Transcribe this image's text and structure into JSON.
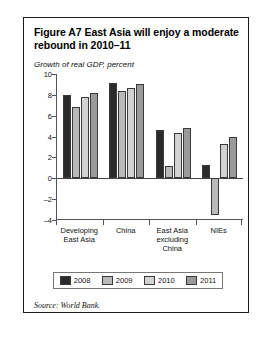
{
  "figure": {
    "title": "Figure A7  East Asia will enjoy a moderate rebound in 2010–11",
    "subtitle": "Growth of real GDP, percent",
    "source": "Source: World Bank."
  },
  "chart_data": {
    "type": "bar",
    "title": "Figure A7  East Asia will enjoy a moderate rebound in 2010–11",
    "subtitle": "Growth of real GDP, percent",
    "xlabel": "",
    "ylabel": "Growth of real GDP, percent",
    "ylim": [
      -4,
      10
    ],
    "ytick_step": 2,
    "yticks": [
      10,
      8,
      6,
      4,
      2,
      0,
      -2,
      -4
    ],
    "ytick_labels": [
      "10",
      "8",
      "6",
      "4",
      "2",
      "0",
      "–2",
      "–4"
    ],
    "grid": false,
    "legend_position": "bottom",
    "categories": [
      "Developing East Asia",
      "China",
      "East Asia excluding China",
      "NIEs"
    ],
    "series": [
      {
        "name": "2008",
        "color": "#2b2b2b",
        "values": [
          8.0,
          9.1,
          4.6,
          1.3
        ]
      },
      {
        "name": "2009",
        "color": "#b9b9b9",
        "values": [
          6.8,
          8.4,
          1.2,
          -3.5
        ]
      },
      {
        "name": "2010",
        "color": "#d2d2d2",
        "values": [
          7.8,
          8.7,
          4.3,
          3.3
        ]
      },
      {
        "name": "2011",
        "color": "#9a9a9a",
        "values": [
          8.2,
          9.0,
          4.8,
          4.0
        ]
      }
    ]
  }
}
